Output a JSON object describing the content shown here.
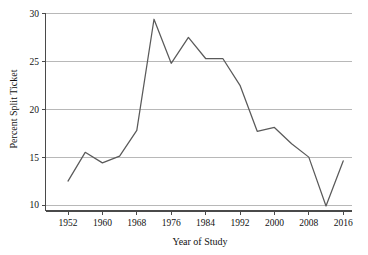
{
  "chart_data": {
    "type": "line",
    "title": "",
    "xlabel": "Year of Study",
    "ylabel": "Percent Split Ticket",
    "xlim": [
      1950,
      2018
    ],
    "ylim": [
      9,
      30.6
    ],
    "grid": true,
    "legend": null,
    "xticks": [
      1952,
      1960,
      1968,
      1976,
      1984,
      1992,
      2000,
      2008,
      2016
    ],
    "xtick_labels": [
      "1952",
      "1960",
      "1968",
      "1976",
      "1984",
      "1992",
      "2000",
      "2008",
      "2016"
    ],
    "yticks": [
      10,
      15,
      20,
      25,
      30
    ],
    "ytick_labels": [
      "10",
      "15",
      "20",
      "25",
      "30"
    ],
    "line_color": "#5a5a5a",
    "grid_color": "#9a9a9a",
    "axis_color": "#4a4a4a",
    "x": [
      1952,
      1956,
      1960,
      1964,
      1968,
      1972,
      1976,
      1980,
      1984,
      1988,
      1992,
      1996,
      2000,
      2004,
      2008,
      2012,
      2016
    ],
    "values": [
      12.5,
      15.5,
      14.4,
      15.1,
      17.8,
      29.4,
      24.8,
      27.5,
      25.3,
      25.3,
      22.5,
      17.7,
      18.1,
      16.4,
      15.0,
      9.9,
      14.6
    ],
    "series": [
      {
        "name": "Percent Split Ticket",
        "values": [
          12.5,
          15.5,
          14.4,
          15.1,
          17.8,
          29.4,
          24.8,
          27.5,
          25.3,
          25.3,
          22.5,
          17.7,
          18.1,
          16.4,
          15.0,
          9.9,
          14.6
        ]
      }
    ]
  }
}
